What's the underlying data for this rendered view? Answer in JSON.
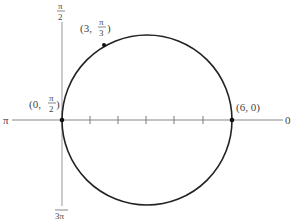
{
  "diagram": {
    "axis_labels": {
      "right": "0",
      "left": "π",
      "top_num": "π",
      "top_den": "2",
      "bottom_num": "3π"
    },
    "points": [
      {
        "name": "origin",
        "label_prefix": "(0, ",
        "label_num": "π",
        "label_den": "2",
        "label_suffix": ")"
      },
      {
        "name": "top-point",
        "label_prefix": "(3, ",
        "label_num": "π",
        "label_den": "3",
        "label_suffix": ")"
      },
      {
        "name": "right-point",
        "label": "(6, 0)"
      }
    ],
    "ticks_on_polar_axis": 5,
    "colors": {
      "curve": "#222222",
      "axis": "#888888",
      "text": "#444444"
    }
  }
}
